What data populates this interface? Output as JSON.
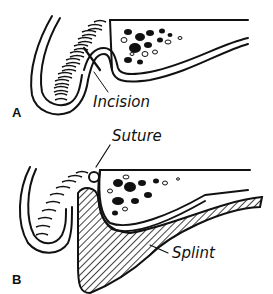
{
  "figure": {
    "panels": [
      {
        "id": "A",
        "letter": "A",
        "annotations": [
          {
            "text": "Incision"
          }
        ],
        "description": "Cross-section of lip and alveolar bone with incision line through mucosa"
      },
      {
        "id": "B",
        "letter": "B",
        "annotations": [
          {
            "text": "Suture"
          },
          {
            "text": "Splint"
          }
        ],
        "description": "Cross-section after suturing with hatched splint placed in the vestibule"
      }
    ],
    "colors": {
      "ink": "#111111",
      "background": "#ffffff"
    }
  }
}
